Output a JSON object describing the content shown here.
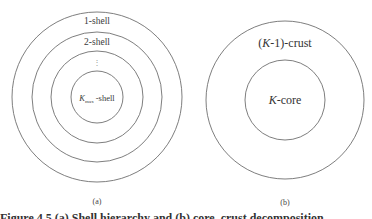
{
  "figure_a": {
    "panel_label": "(a)",
    "shells": [
      {
        "label": "1-shell"
      },
      {
        "label": "2-shell"
      },
      {
        "label": "⋮"
      },
      {
        "label_prefix": "K",
        "label_sub": "max",
        "label_suffix": " -shell"
      }
    ],
    "geometry": {
      "cx": 97,
      "cy": 97,
      "radii": [
        85,
        65,
        46,
        26
      ]
    }
  },
  "figure_b": {
    "panel_label": "(b)",
    "outer_label_open": "(",
    "outer_label_kappa": "K",
    "outer_label_rest": "-1)-crust",
    "inner_label_kappa": "K",
    "inner_label_rest": "-core",
    "geometry": {
      "cx": 285,
      "cy": 100,
      "radii": [
        79,
        40
      ]
    }
  },
  "caption": {
    "text": "Figure 4.5  (a) Shell hierarchy and (b) core–crust decomposition"
  },
  "colors": {
    "stroke": "#6f6f6f",
    "text": "#333333",
    "background": "#ffffff"
  }
}
